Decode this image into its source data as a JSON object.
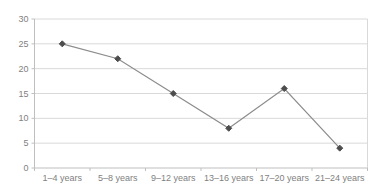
{
  "chart_data": {
    "type": "line",
    "categories": [
      "1–4 years",
      "5–8 years",
      "9–12 years",
      "13–16 years",
      "17–20 years",
      "21–24 years"
    ],
    "values": [
      25,
      22,
      15,
      8,
      16,
      4
    ],
    "series_name": "",
    "title": "",
    "xlabel": "",
    "ylabel": "",
    "ylim": [
      0,
      30
    ],
    "ytick_step": 5,
    "ytick_labels": [
      "0",
      "5",
      "10",
      "15",
      "20",
      "25",
      "30"
    ],
    "grid": true,
    "legend": false,
    "legend_position": "none",
    "marker_shape": "diamond",
    "colors": {
      "background": "#ffffff",
      "gridline": "#d9d9d9",
      "plot_border": "#d9d9d9",
      "axis_line": "#bfbfbf",
      "tick_mark": "#bfbfbf",
      "line": "#8c8c8c",
      "marker": "#4d4d4d",
      "label_text": "#7f7f7f"
    }
  }
}
